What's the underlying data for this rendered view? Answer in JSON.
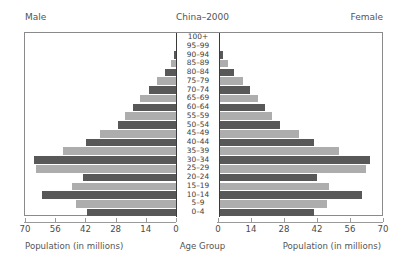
{
  "header": {
    "male_label": "Male",
    "female_label": "Female",
    "title": "China–2000"
  },
  "footer": {
    "left_caption": "Population (in millions)",
    "center_caption": "Age Group",
    "right_caption": "Population (in millions)"
  },
  "axis": {
    "left_ticks": [
      "70",
      "56",
      "42",
      "28",
      "14",
      "0"
    ],
    "right_ticks": [
      "0",
      "14",
      "28",
      "42",
      "56",
      "70"
    ],
    "max": 70,
    "tick_step": 14
  },
  "colors": {
    "bar_dark": "#585858",
    "bar_light": "#adadad",
    "frame": "#8a8a8a",
    "axis": "#9a9a9a",
    "text": "#4a4a4a"
  },
  "chart_data": {
    "type": "bar",
    "subtype": "population-pyramid",
    "title": "China–2000",
    "xlabel": "Population (in millions)",
    "ylabel": "Age Group",
    "xlim": [
      0,
      70
    ],
    "xticks": [
      0,
      14,
      28,
      42,
      56,
      70
    ],
    "grid": false,
    "legend": "none",
    "categories": [
      "0–4",
      "5–9",
      "10–14",
      "15–19",
      "20–24",
      "25–29",
      "30–34",
      "35–39",
      "40–44",
      "45–49",
      "50–54",
      "55–59",
      "60–64",
      "65–69",
      "70–74",
      "75–79",
      "80–84",
      "85–89",
      "90–94",
      "95–99",
      "100+"
    ],
    "series": [
      {
        "name": "Male",
        "side": "left",
        "values": [
          41.5,
          47.0,
          62.5,
          48.5,
          43.5,
          65.5,
          66.5,
          53.0,
          42.0,
          35.5,
          27.5,
          24.0,
          20.5,
          17.0,
          13.0,
          9.5,
          5.5,
          3.0,
          1.2,
          0.35,
          0.08
        ]
      },
      {
        "name": "Female",
        "side": "right",
        "values": [
          40.5,
          46.0,
          60.5,
          46.5,
          41.5,
          62.5,
          64.0,
          51.0,
          40.5,
          34.0,
          26.0,
          22.5,
          19.5,
          16.5,
          13.0,
          10.0,
          6.5,
          3.8,
          1.7,
          0.55,
          0.12
        ]
      }
    ]
  }
}
